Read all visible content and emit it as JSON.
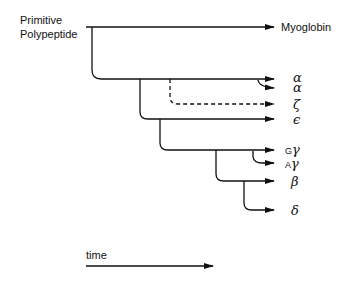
{
  "diagram": {
    "root_label_line1": "Primitive",
    "root_label_line2": "Polypeptide",
    "leaves": [
      {
        "id": "myoglobin",
        "label": "Myoglobin"
      },
      {
        "id": "alpha1",
        "label": "α"
      },
      {
        "id": "alpha2",
        "label": "α"
      },
      {
        "id": "zeta",
        "label": "ζ",
        "style": "dashed"
      },
      {
        "id": "epsilon",
        "label": "ϵ"
      },
      {
        "id": "g-gamma",
        "prefix": "G",
        "label": "γ"
      },
      {
        "id": "a-gamma",
        "prefix": "A",
        "label": "γ"
      },
      {
        "id": "beta",
        "label": "β"
      },
      {
        "id": "delta",
        "label": "δ"
      }
    ],
    "time_axis_label": "time",
    "line_color": "#111111"
  }
}
